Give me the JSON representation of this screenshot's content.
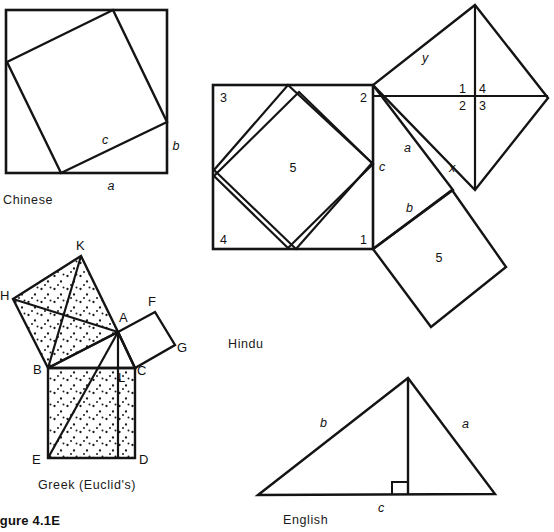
{
  "figure": {
    "number_label": "igure 4.1E",
    "panels": [
      {
        "id": "chinese",
        "caption": "Chinese"
      },
      {
        "id": "hindu",
        "caption": "Hindu"
      },
      {
        "id": "greek",
        "caption": "Greek  (Euclid's)"
      },
      {
        "id": "english",
        "caption": "English"
      }
    ]
  },
  "chinese": {
    "caption": "Chinese",
    "labels": {
      "a": "a",
      "b": "b",
      "c": "c"
    }
  },
  "hindu": {
    "caption": "Hindu",
    "left_square_corner_numbers": {
      "top_left": "3",
      "top_right": "2",
      "bottom_left": "4",
      "bottom_right": "1"
    },
    "left_square_center": "5",
    "lower_square_center": "5",
    "right_square_quadrants": {
      "top_left": "1",
      "top_right": "4",
      "bottom_left": "2",
      "bottom_right": "3"
    },
    "side_labels": {
      "a": "a",
      "b": "b",
      "c": "c",
      "x": "x",
      "y": "y"
    }
  },
  "greek": {
    "caption": "Greek  (Euclid's)",
    "points": {
      "A": "A",
      "B": "B",
      "C": "C",
      "D": "D",
      "E": "E",
      "F": "F",
      "G": "G",
      "H": "H",
      "K": "K",
      "L": "L"
    }
  },
  "english": {
    "caption": "English",
    "labels": {
      "a": "a",
      "b": "b",
      "c": "c"
    },
    "right_angle_marker": true
  },
  "style": {
    "ink": "#141414",
    "paper": "#ffffff",
    "stipple": "#1a1a1a"
  }
}
